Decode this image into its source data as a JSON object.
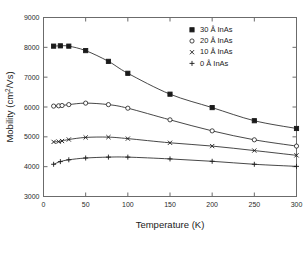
{
  "chart_data": {
    "type": "line",
    "title": "",
    "xlabel": "Temperature (K)",
    "ylabel": "Mobility (cm2/Vs)",
    "ylabel_display": "Mobility (cm",
    "ylabel_sup": "2",
    "ylabel_tail": "/Vs)",
    "xlim": [
      0,
      300
    ],
    "ylim": [
      3000,
      9000
    ],
    "xticks": [
      0,
      50,
      100,
      150,
      200,
      250,
      300
    ],
    "yticks": [
      3000,
      4000,
      5000,
      6000,
      7000,
      8000,
      9000
    ],
    "grid": false,
    "legend_position": "top-right",
    "series": [
      {
        "name": "30 Å InAs",
        "thickness": "30",
        "unit": "Å",
        "material": "InAs",
        "marker": "square",
        "x": [
          12,
          20,
          30,
          50,
          77,
          100,
          150,
          200,
          250,
          300
        ],
        "y": [
          8040,
          8050,
          8040,
          7890,
          7530,
          7130,
          6430,
          5980,
          5540,
          5280
        ]
      },
      {
        "name": "20 Å InAs",
        "thickness": "20",
        "unit": "Å",
        "material": "InAs",
        "marker": "circle",
        "x": [
          12,
          18,
          22,
          30,
          50,
          77,
          100,
          150,
          200,
          250,
          300
        ],
        "y": [
          6030,
          6040,
          6050,
          6080,
          6130,
          6080,
          5960,
          5570,
          5200,
          4900,
          4690
        ]
      },
      {
        "name": "10 Å InAs",
        "thickness": "10",
        "unit": "Å",
        "material": "InAs",
        "marker": "cross",
        "x": [
          12,
          18,
          22,
          30,
          50,
          77,
          100,
          150,
          200,
          250,
          300
        ],
        "y": [
          4830,
          4840,
          4860,
          4910,
          4980,
          4990,
          4940,
          4800,
          4690,
          4540,
          4380
        ]
      },
      {
        "name": "0  Å InAs",
        "thickness": "0",
        "unit": "Å",
        "material": "InAs",
        "marker": "plus",
        "x": [
          12,
          20,
          30,
          50,
          77,
          100,
          150,
          200,
          250,
          300
        ],
        "y": [
          4080,
          4170,
          4230,
          4290,
          4320,
          4320,
          4260,
          4180,
          4080,
          4010
        ]
      }
    ],
    "legend": [
      {
        "marker": "square",
        "label": "30 Å InAs"
      },
      {
        "marker": "circle",
        "label": "20 Å InAs"
      },
      {
        "marker": "cross",
        "label": "10 Å InAs"
      },
      {
        "marker": "plus",
        "label": "0  Å InAs"
      }
    ],
    "colors": {
      "line": "#333333",
      "marker": "#1a1a1a",
      "axis": "#6b6b6b",
      "text": "#1a1a1a",
      "background": "#ffffff"
    }
  }
}
